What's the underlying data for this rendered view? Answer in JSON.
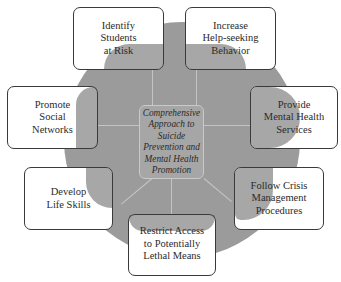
{
  "diagram": {
    "center": {
      "label": "Comprehensive\nApproach to\nSuicide\nPrevention and\nMental Health\nPromotion"
    },
    "nodes": [
      {
        "id": "identify",
        "label": "Identify\nStudents\nat Risk"
      },
      {
        "id": "help-seeking",
        "label": "Increase\nHelp-seeking\nBehavior"
      },
      {
        "id": "social",
        "label": "Promote\nSocial\nNetworks"
      },
      {
        "id": "mental-health",
        "label": "Provide\nMental Health\nServices"
      },
      {
        "id": "life-skills",
        "label": "Develop\nLife Skills"
      },
      {
        "id": "crisis",
        "label": "Follow Crisis\nManagement\nProcedures"
      },
      {
        "id": "lethal-means",
        "label": "Restrict Access\nto Potentially\nLethal Means"
      }
    ],
    "colors": {
      "circle": "#9b9b9b",
      "center_box": "#a6a6a6",
      "box_border": "#3a3a3a",
      "overlap": "#6e6e6e",
      "background": "#ffffff"
    }
  }
}
